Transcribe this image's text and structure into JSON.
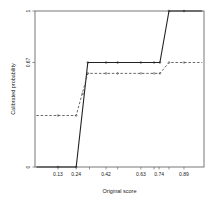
{
  "chart_data": {
    "type": "line",
    "title": "",
    "xlabel": "Original score",
    "ylabel": "Calibrated probability",
    "xlim": [
      0.0,
      1.0
    ],
    "ylim": [
      0.0,
      1.0
    ],
    "grid": false,
    "legend": null,
    "x_ticks": [
      0.13,
      0.24,
      0.42,
      0.63,
      0.74,
      0.89
    ],
    "x_tick_labels": [
      "0.13",
      "0.24",
      "0.42",
      "0.63",
      "0.74",
      "0.89"
    ],
    "x_minor_ticks": [
      0.32,
      0.49,
      0.71,
      0.8
    ],
    "y_ticks": [
      0,
      0.67,
      1
    ],
    "y_tick_labels": [
      "0",
      "0.67",
      "1"
    ],
    "series": [
      {
        "name": "solid",
        "style": "solid",
        "color": "#222222",
        "x": [
          0.0,
          0.24,
          0.31,
          0.42,
          0.49,
          0.63,
          0.71,
          0.745,
          0.8,
          1.0
        ],
        "y": [
          0.0,
          0.0,
          0.67,
          0.67,
          0.67,
          0.67,
          0.67,
          0.67,
          1.0,
          1.0
        ],
        "markers_x": [
          0.13,
          0.24,
          0.31,
          0.42,
          0.49,
          0.63,
          0.71,
          0.745,
          0.8,
          0.89
        ],
        "markers_y": [
          0.0,
          0.0,
          0.67,
          0.67,
          0.67,
          0.67,
          0.67,
          0.67,
          1.0,
          1.0
        ]
      },
      {
        "name": "dashed",
        "style": "dashed",
        "color": "#444444",
        "x": [
          0.0,
          0.24,
          0.31,
          0.42,
          0.49,
          0.63,
          0.71,
          0.745,
          0.8,
          1.0
        ],
        "y": [
          0.33,
          0.33,
          0.6,
          0.6,
          0.6,
          0.6,
          0.6,
          0.6,
          0.67,
          0.67
        ],
        "markers_x": [
          0.13,
          0.24,
          0.28,
          0.31,
          0.42,
          0.49,
          0.63,
          0.71,
          0.745,
          0.8,
          0.89
        ],
        "markers_y": [
          0.33,
          0.33,
          0.47,
          0.6,
          0.6,
          0.6,
          0.6,
          0.6,
          0.6,
          0.67,
          0.67
        ]
      }
    ]
  }
}
